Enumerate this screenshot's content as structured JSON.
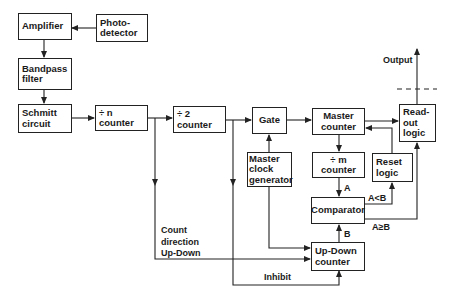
{
  "blocks": {
    "amplifier": [
      "Amplifier"
    ],
    "photodetector": [
      "Photo-",
      "detector"
    ],
    "bandpass": [
      "Bandpass",
      "filter"
    ],
    "schmitt": [
      "Schmitt",
      "circuit"
    ],
    "div_n": [
      "÷ n",
      "counter"
    ],
    "div_2": [
      "÷ 2",
      "counter"
    ],
    "gate": [
      "Gate"
    ],
    "master_counter": [
      "Master",
      "counter"
    ],
    "readout": [
      "Read-",
      "out",
      "logic"
    ],
    "master_clock": [
      "Master",
      "clock",
      "generator"
    ],
    "div_m": [
      "÷ m",
      "counter"
    ],
    "reset": [
      "Reset",
      "logic"
    ],
    "comparator": [
      "Comparator"
    ],
    "updown": [
      "Up-Down",
      "counter"
    ]
  },
  "labels": {
    "output": "Output",
    "count_dir": [
      "Count",
      "direction",
      "Up-Down"
    ],
    "inhibit": "Inhibit",
    "a": "A",
    "b": "B",
    "a_lt_b": "A<B",
    "a_ge_b": "A≥B"
  }
}
